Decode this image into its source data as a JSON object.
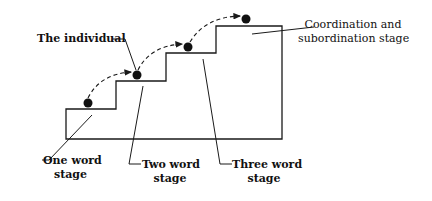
{
  "diagram": {
    "type": "staircase-stages",
    "colors": {
      "stroke": "#1a1a1a",
      "background": "#ffffff"
    },
    "labels": {
      "individual": "The individual",
      "coordination_line1": "Coordination and",
      "coordination_line2": "subordination stage",
      "one_word_line1": "One word",
      "one_word_line2": "stage",
      "two_word_line1": "Two word",
      "two_word_line2": "stage",
      "three_word_line1": "Three word",
      "three_word_line2": "stage"
    },
    "stages": [
      {
        "name": "One word stage",
        "step": 1
      },
      {
        "name": "Two word stage",
        "step": 2
      },
      {
        "name": "Three word stage",
        "step": 3
      },
      {
        "name": "Coordination and subordination stage",
        "step": 4
      }
    ],
    "individual_positions": 4
  }
}
